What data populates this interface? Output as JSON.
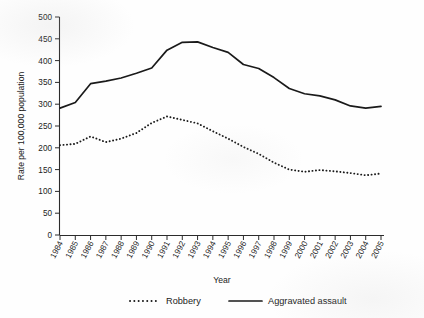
{
  "chart_data": {
    "type": "line",
    "title": "",
    "xlabel": "Year",
    "ylabel": "Rate per 100,000 population",
    "categories": [
      "1984",
      "1985",
      "1986",
      "1987",
      "1988",
      "1989",
      "1990",
      "1991",
      "1992",
      "1993",
      "1994",
      "1995",
      "1996",
      "1997",
      "1998",
      "1999",
      "2000",
      "2001",
      "2002",
      "2003",
      "2004",
      "2005"
    ],
    "x": [
      1984,
      1985,
      1986,
      1987,
      1988,
      1989,
      1990,
      1991,
      1992,
      1993,
      1994,
      1995,
      1996,
      1997,
      1998,
      1999,
      2000,
      2001,
      2002,
      2003,
      2004,
      2005
    ],
    "ylim": [
      0,
      500
    ],
    "yticks": [
      0,
      50,
      100,
      150,
      200,
      250,
      300,
      350,
      400,
      450,
      500
    ],
    "grid": false,
    "legend_position": "bottom",
    "series": [
      {
        "name": "Robbery",
        "style": "dotted",
        "color": "#1a1a1a",
        "values": [
          206,
          209,
          226,
          213,
          221,
          234,
          257,
          272,
          264,
          256,
          238,
          221,
          202,
          186,
          166,
          150,
          145,
          149,
          146,
          142,
          137,
          141
        ]
      },
      {
        "name": "Aggravated assault",
        "style": "solid",
        "color": "#1a1a1a",
        "values": [
          291,
          304,
          347,
          353,
          360,
          371,
          383,
          424,
          442,
          443,
          430,
          419,
          391,
          382,
          361,
          336,
          324,
          319,
          310,
          296,
          291,
          295
        ]
      }
    ]
  },
  "axes": {
    "y_title": "Rate per 100,000 population",
    "x_title": "Year",
    "y_tick_labels": [
      "500",
      "450",
      "400",
      "350",
      "300",
      "250",
      "200",
      "150",
      "100",
      "50",
      "0"
    ],
    "x_tick_labels": [
      "1984",
      "1985",
      "1986",
      "1987",
      "1988",
      "1989",
      "1990",
      "1991",
      "1992",
      "1993",
      "1994",
      "1995",
      "1996",
      "1997",
      "1998",
      "1999",
      "2000",
      "2001",
      "2002",
      "2003",
      "2004",
      "2005"
    ]
  },
  "legend": {
    "items": [
      {
        "label": "Robbery",
        "style": "dotted"
      },
      {
        "label": "Aggravated assault",
        "style": "solid"
      }
    ]
  }
}
